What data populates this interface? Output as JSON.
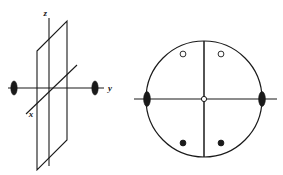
{
  "figure": {
    "background_color": "#ffffff",
    "stroke_color": "#1a1a1a",
    "width": 283,
    "height": 175
  },
  "left_panel": {
    "name": "axial-plane-diagram",
    "description": "Vertical mirror plane drawn in oblique projection with x, y and z crystallographic axes",
    "axis_labels": {
      "z": "z",
      "y": "y",
      "x": "x"
    },
    "axes": [
      {
        "id": "z-axis",
        "label": "z",
        "orientation": "vertical",
        "label_x": 47,
        "label_y": 16,
        "x1": 49,
        "y1": 18,
        "x2": 49,
        "y2": 166
      },
      {
        "id": "y-axis",
        "label": "y",
        "orientation": "horizontal",
        "label_x": 108,
        "label_y": 91,
        "x1": 8,
        "y1": 88,
        "x2": 104,
        "y2": 88
      },
      {
        "id": "x-axis",
        "label": "x",
        "orientation": "oblique",
        "label_x": 31,
        "label_y": 116,
        "x1": 26,
        "y1": 114,
        "x2": 77,
        "y2": 65
      }
    ],
    "plane": {
      "id": "mirror-plane",
      "shape": "parallelogram",
      "corners": [
        {
          "x": 37,
          "y": 51
        },
        {
          "x": 67,
          "y": 21
        },
        {
          "x": 67,
          "y": 140
        },
        {
          "x": 37,
          "y": 170
        }
      ]
    },
    "markers": [
      {
        "id": "two-fold-axis-marker-left",
        "type": "filled-lens",
        "cx": 14,
        "cy": 88,
        "rx": 3.2,
        "ry": 7.0,
        "fill": "#1a1a1a"
      },
      {
        "id": "two-fold-axis-marker-right",
        "type": "filled-lens",
        "cx": 95,
        "cy": 88,
        "rx": 3.2,
        "ry": 7.0,
        "fill": "#1a1a1a"
      }
    ]
  },
  "right_panel": {
    "name": "stereographic-projection-diagram",
    "description": "Stereographic projection: primitive circle with vertical and horizontal trace lines, two open poles above and two filled poles below",
    "primitive_circle": {
      "cx": 204,
      "cy": 99,
      "r": 58,
      "fill": "none",
      "stroke": "#1a1a1a"
    },
    "trace_lines": [
      {
        "id": "vertical-trace",
        "x1": 204,
        "y1": 41,
        "x2": 204,
        "y2": 157
      },
      {
        "id": "horizontal-trace",
        "x1": 134,
        "y1": 99,
        "x2": 277,
        "y2": 99
      }
    ],
    "center_marker": {
      "id": "center-open-pole",
      "type": "open-circle",
      "cx": 204,
      "cy": 99,
      "r": 2.6,
      "fill": "#ffffff",
      "stroke": "#1a1a1a"
    },
    "edge_markers": [
      {
        "id": "two-fold-axis-marker-west",
        "type": "filled-lens",
        "cx": 147,
        "cy": 99,
        "rx": 3.4,
        "ry": 7.4,
        "fill": "#1a1a1a"
      },
      {
        "id": "two-fold-axis-marker-east",
        "type": "filled-lens",
        "cx": 262,
        "cy": 99,
        "rx": 3.4,
        "ry": 7.4,
        "fill": "#1a1a1a"
      }
    ],
    "poles": [
      {
        "id": "open-pole-upper-left",
        "type": "open-circle",
        "cx": 183,
        "cy": 54,
        "r": 2.9,
        "fill": "#ffffff",
        "stroke": "#1a1a1a"
      },
      {
        "id": "open-pole-upper-right",
        "type": "open-circle",
        "cx": 221,
        "cy": 54,
        "r": 2.9,
        "fill": "#ffffff",
        "stroke": "#1a1a1a"
      },
      {
        "id": "filled-pole-lower-left",
        "type": "filled-circle",
        "cx": 183,
        "cy": 143,
        "r": 2.9,
        "fill": "#1a1a1a",
        "stroke": "#1a1a1a"
      },
      {
        "id": "filled-pole-lower-right",
        "type": "filled-circle",
        "cx": 221,
        "cy": 143,
        "r": 2.9,
        "fill": "#1a1a1a",
        "stroke": "#1a1a1a"
      }
    ]
  }
}
